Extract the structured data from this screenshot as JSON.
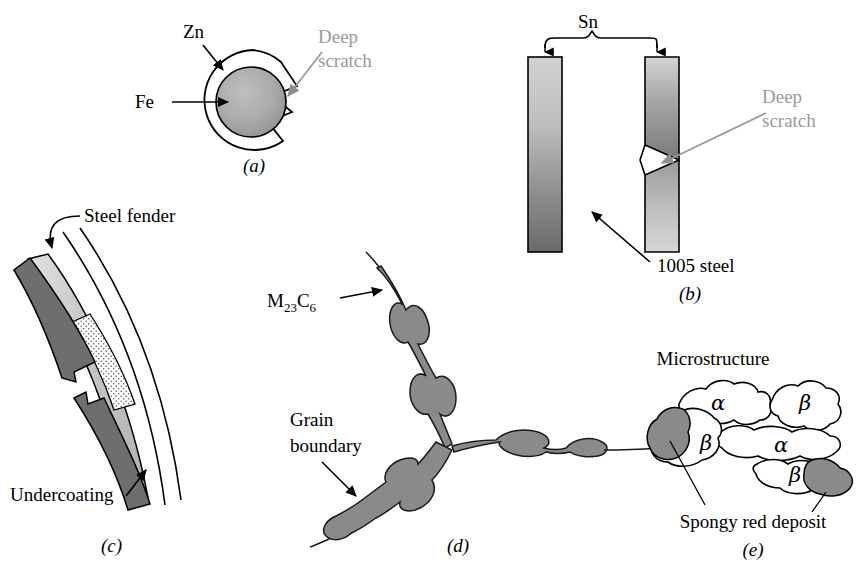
{
  "figure": {
    "background": "#ffffff",
    "width": 866,
    "height": 573,
    "colors": {
      "ink": "#000000",
      "gray_text": "#9a9a9a",
      "fe_core": "#a9a9a9",
      "sn_light": "#c9c9c9",
      "sn_dark": "#6f6f6f",
      "undercoat_dark": "#6e6e6e",
      "undercoat_light": "#c6c6c6",
      "carbide": "#8a8a8a",
      "deposit": "#8a8a8a"
    }
  },
  "panels": [
    {
      "id": "a",
      "label": "(a)",
      "labels": {
        "zn": "Zn",
        "fe": "Fe",
        "scratch_line1": "Deep",
        "scratch_line2": "scratch"
      }
    },
    {
      "id": "b",
      "label": "(b)",
      "labels": {
        "sn": "Sn",
        "scratch_line1": "Deep",
        "scratch_line2": "scratch",
        "steel": "1005 steel"
      }
    },
    {
      "id": "c",
      "label": "(c)",
      "labels": {
        "fender": "Steel fender",
        "undercoating": "Undercoating"
      }
    },
    {
      "id": "d",
      "label": "(d)",
      "labels": {
        "carbide": "M",
        "carbide_sub1": "23",
        "carbide_mid": "C",
        "carbide_sub2": "6",
        "grain_line1": "Grain",
        "grain_line2": "boundary"
      }
    },
    {
      "id": "e",
      "label": "(e)",
      "labels": {
        "microstructure": "Microstructure",
        "deposit": "Spongy red deposit",
        "phase_alpha": "α",
        "phase_beta": "β",
        "grains": [
          "α",
          "β",
          "α",
          "β",
          "β"
        ]
      }
    }
  ]
}
